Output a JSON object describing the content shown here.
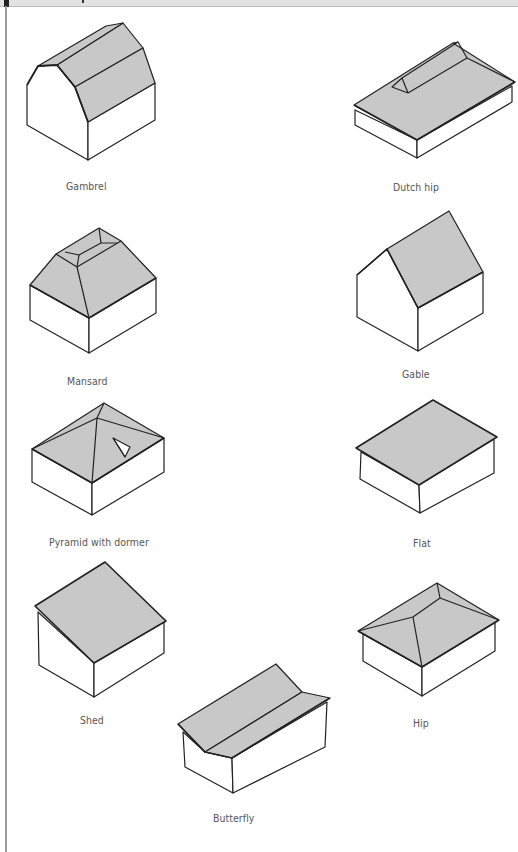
{
  "figure": {
    "colors": {
      "roof": "#c8c8c8",
      "wall": "#ffffff",
      "stroke": "#222222",
      "label": "#555555"
    },
    "roofs": [
      {
        "id": "gambrel",
        "label": "Gambrel"
      },
      {
        "id": "dutch-hip",
        "label": "Dutch hip"
      },
      {
        "id": "mansard",
        "label": "Mansard"
      },
      {
        "id": "gable",
        "label": "Gable"
      },
      {
        "id": "pyramid-with-dormer",
        "label": "Pyramid with dormer"
      },
      {
        "id": "flat",
        "label": "Flat"
      },
      {
        "id": "shed",
        "label": "Shed"
      },
      {
        "id": "hip",
        "label": "Hip"
      },
      {
        "id": "butterfly",
        "label": "Butterfly"
      }
    ]
  }
}
